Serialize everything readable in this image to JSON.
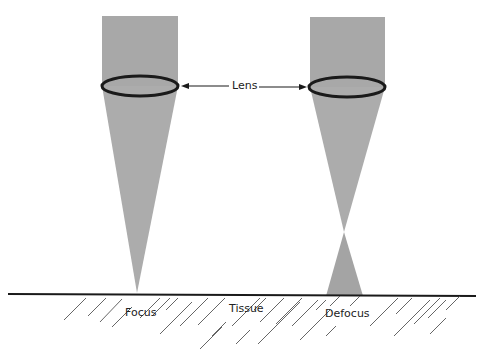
{
  "diagram": {
    "labels": {
      "lens": "Lens",
      "focus": "Focus",
      "tissue": "Tissue",
      "defocus": "Defocus"
    },
    "colors": {
      "beam": "#a8a8a8",
      "lens_outline": "#1a1a1a",
      "ground": "#1a1a1a",
      "hatch": "#555555",
      "background": "#ffffff"
    }
  }
}
